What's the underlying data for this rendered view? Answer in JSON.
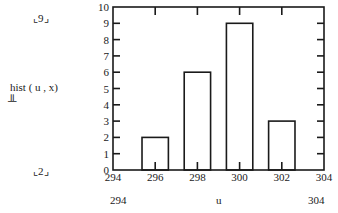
{
  "ylabel": "hist ( u , x)",
  "ylabel_marker": "╨",
  "y_range_markers": {
    "top": "9",
    "bottom": "2"
  },
  "x_range_labels": {
    "left": "294",
    "center": "u",
    "right": "304"
  },
  "chart_data": {
    "type": "bar",
    "title": "",
    "xlabel": "u",
    "ylabel": "hist ( u , x)",
    "categories": [
      "296",
      "298",
      "300",
      "302"
    ],
    "x": [
      296,
      298,
      300,
      302
    ],
    "values": [
      2,
      6,
      9,
      3
    ],
    "bar_width": 1.25,
    "xlim": [
      294,
      304
    ],
    "ylim": [
      0,
      10
    ],
    "x_ticks": [
      294,
      296,
      298,
      300,
      302,
      304
    ],
    "y_ticks": [
      0,
      1,
      2,
      3,
      4,
      5,
      6,
      7,
      8,
      9,
      10
    ],
    "grid": false,
    "legend": null,
    "bar_fill": "#ffffff",
    "bar_stroke": "#1a1a1a"
  }
}
